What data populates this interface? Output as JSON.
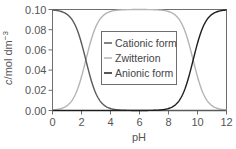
{
  "chart_data": {
    "type": "line",
    "title": "",
    "xlabel": "pH",
    "ylabel": "c/mol dm⁻³",
    "ylabel_parts": {
      "italic": "c",
      "unit": "/mol dm",
      "sup": "−3"
    },
    "xlim": [
      0,
      12
    ],
    "ylim": [
      0,
      0.1
    ],
    "x_ticks": [
      0,
      2,
      4,
      6,
      8,
      10,
      12
    ],
    "x_tick_labels": [
      "0",
      "2",
      "4",
      "6",
      "8",
      "10",
      "12"
    ],
    "y_ticks": [
      0,
      0.02,
      0.04,
      0.06,
      0.08,
      0.1
    ],
    "y_tick_labels": [
      "0.00",
      "0.02",
      "0.04",
      "0.06",
      "0.08",
      "0.10"
    ],
    "grid": false,
    "legend_position": "center",
    "total_concentration": 0.1,
    "pKa1": 2.3,
    "pKa2": 9.7,
    "x": [
      0,
      1,
      2,
      2.3,
      3,
      4,
      5,
      6,
      7,
      8,
      9,
      9.7,
      10,
      11,
      12
    ],
    "series": [
      {
        "name": "Cationic form",
        "color": "#5a5a5a",
        "values": [
          0.0995,
          0.0952,
          0.0666,
          0.05,
          0.0166,
          0.002,
          0.0002,
          0.0,
          0.0,
          0.0,
          0.0,
          0.0,
          0.0,
          0.0,
          0.0
        ]
      },
      {
        "name": "Zwitterion",
        "color": "#b4b4b4",
        "values": [
          0.0005,
          0.0048,
          0.0334,
          0.05,
          0.0834,
          0.098,
          0.0998,
          0.1,
          0.0995,
          0.098,
          0.0834,
          0.05,
          0.0334,
          0.0048,
          0.0005
        ]
      },
      {
        "name": "Anionic form",
        "color": "#1e1e1e",
        "values": [
          0.0,
          0.0,
          0.0,
          0.0,
          0.0,
          0.0,
          0.0,
          0.0,
          0.0005,
          0.002,
          0.0166,
          0.05,
          0.0666,
          0.0952,
          0.0995
        ]
      }
    ]
  },
  "legend": {
    "items": [
      {
        "label": "Cationic form",
        "color": "#5a5a5a"
      },
      {
        "label": "Zwitterion",
        "color": "#b4b4b4"
      },
      {
        "label": "Anionic form",
        "color": "#1e1e1e"
      }
    ]
  },
  "colors": {
    "axis": "#6e6e6e",
    "text": "#555555"
  }
}
